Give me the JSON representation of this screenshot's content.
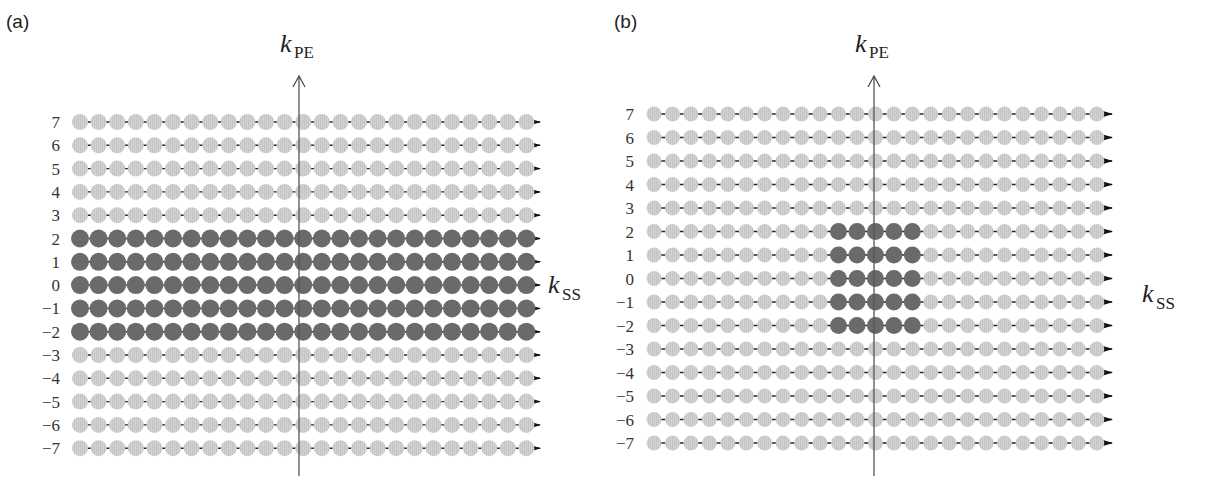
{
  "figure": {
    "colors": {
      "sampled_dot": "#6a6a6a",
      "unsampled_dot": "#d2d2d2",
      "unsampled_stripe": "#c2c2c2",
      "line": "#222222",
      "axis": "#555555",
      "text": "#222222"
    },
    "columns_per_row": 25,
    "row_values": [
      "7",
      "6",
      "5",
      "4",
      "3",
      "2",
      "1",
      "0",
      "−1",
      "−2",
      "−3",
      "−4",
      "−5",
      "−6",
      "−7"
    ],
    "panels": [
      {
        "id": "a",
        "label": "(a)",
        "vertical_axis": {
          "k": "k",
          "sub": "PE"
        },
        "horizontal_axis": {
          "k": "k",
          "sub": "SS"
        },
        "description": "Rows -2..2 fully sampled across all k_SS columns",
        "sampled_rows": [
          "2",
          "1",
          "0",
          "−1",
          "−2"
        ],
        "sampled_columns": "all"
      },
      {
        "id": "b",
        "label": "(b)",
        "vertical_axis": {
          "k": "k",
          "sub": "PE"
        },
        "horizontal_axis": {
          "k": "k",
          "sub": "SS"
        },
        "description": "Central 5x5 block (rows -2..2, columns -2..2) sampled",
        "sampled_rows": [
          "2",
          "1",
          "0",
          "−1",
          "−2"
        ],
        "sampled_columns": [
          -2,
          -1,
          0,
          1,
          2
        ]
      }
    ]
  }
}
